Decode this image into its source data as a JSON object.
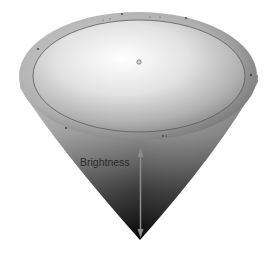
{
  "diagram": {
    "type": "brightness-cone",
    "labels": {
      "brightness": "Brightness"
    },
    "colors": {
      "top_center": "#ffffff",
      "top_edge": "#8a8a8a",
      "rim": "#9a9a9a",
      "apex": "#0a0a0a",
      "arrow": "#8c8c8c",
      "ring_line": "#555555"
    },
    "icons": {
      "arrow": "double-headed-vertical-arrow"
    }
  }
}
